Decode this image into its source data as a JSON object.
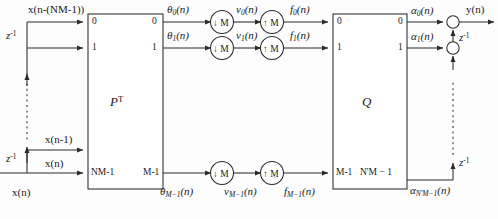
{
  "diagram": {
    "background": "#fdfdfd",
    "line_color": "#2a2a2a"
  },
  "input": {
    "source_label": "x(n)",
    "top_tap_label": "x(n-(NM-1))",
    "second_tap_label": "x(n-1)",
    "delay_upper_label": "z",
    "delay_upper_exp": "-1",
    "delay_lower_label": "z",
    "delay_lower_exp": "-1"
  },
  "blocks": {
    "analysis": {
      "name": "P",
      "transpose": "T",
      "in_ports": [
        "0",
        "1",
        "NM-1"
      ],
      "out_ports": [
        "0",
        "1",
        "M-1"
      ]
    },
    "synthesis": {
      "name": "Q",
      "in_ports": [
        "0",
        "1",
        "M-1"
      ],
      "out_ports": [
        "0",
        "1",
        "N'M − 1"
      ]
    }
  },
  "branches": [
    {
      "theta": "θ",
      "theta_sub": "0",
      "v": "v",
      "v_sub": "0",
      "f": "f",
      "f_sub": "0",
      "down_label": "↓ M",
      "up_label": "↑ M"
    },
    {
      "theta": "θ",
      "theta_sub": "1",
      "v": "v",
      "v_sub": "1",
      "f": "f",
      "f_sub": "1",
      "down_label": "↓ M",
      "up_label": "↑ M"
    },
    {
      "theta": "θ",
      "theta_sub": "M−1",
      "v": "v",
      "v_sub": "M−1",
      "f": "f",
      "f_sub": "M−1",
      "down_label": "↓ M",
      "up_label": "↑ M"
    }
  ],
  "outputs": {
    "alpha0": "α",
    "alpha0_sub": "0",
    "alpha1": "α",
    "alpha1_sub": "1",
    "alphaN": "α",
    "alphaN_sub": "N'M−1",
    "arg": "(n)",
    "y_label": "y(n)",
    "delay_top_label": "z",
    "delay_top_exp": "-1",
    "delay_bottom_label": "z",
    "delay_bottom_exp": "-1"
  }
}
